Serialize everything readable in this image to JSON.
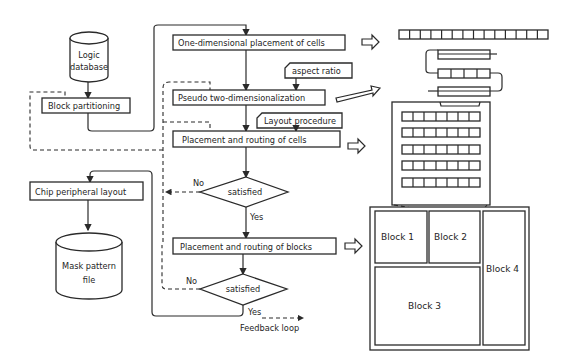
{
  "diagram": {
    "left_column": {
      "logic_database": [
        "Logic",
        "database"
      ],
      "block_partitioning": "Block partitioning",
      "chip_peripheral_layout": "Chip peripheral layout",
      "mask_pattern_file": [
        "Mask pattern",
        "file"
      ]
    },
    "center_column": {
      "one_dim_placement": "One-dimensional placement of cells",
      "aspect_ratio": "aspect ratio",
      "pseudo_2d": "Pseudo two-dimensionalization",
      "layout_procedure": "Layout procedure",
      "placement_routing_cells": "Placement and routing of cells",
      "decision1": "satisfied",
      "decision1_no": "No",
      "decision1_yes": "Yes",
      "placement_routing_blocks": "Placement and routing of blocks",
      "decision2": "satisfied",
      "decision2_no": "No",
      "decision2_yes": "Yes",
      "feedback_loop": "Feedback loop"
    },
    "right_column": {
      "one_dim_row_cells": 14,
      "folded_rows": 3,
      "grid_rows": 5,
      "grid_cols": 7,
      "blocks": [
        "Block 1",
        "Block 2",
        "Block 3",
        "Block 4"
      ]
    }
  }
}
